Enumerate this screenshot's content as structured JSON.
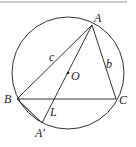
{
  "diagram": {
    "type": "circumscribed-triangle",
    "circle": {
      "center_label": "O",
      "cx": 68,
      "cy": 73,
      "r": 56
    },
    "points": {
      "A": {
        "label": "A",
        "x": 92,
        "y": 25
      },
      "B": {
        "label": "B",
        "x": 17,
        "y": 99
      },
      "C": {
        "label": "C",
        "x": 116,
        "y": 99
      },
      "L": {
        "label": "L",
        "x": 53,
        "y": 99
      },
      "A_prime": {
        "label": "A'",
        "x": 42,
        "y": 123
      }
    },
    "side_labels": {
      "c": "c",
      "b": "b"
    },
    "segments": [
      "AB",
      "AC",
      "BC",
      "AA'",
      "BA'"
    ],
    "colors": {
      "stroke": "#333333",
      "top_rule": "#999999"
    }
  }
}
